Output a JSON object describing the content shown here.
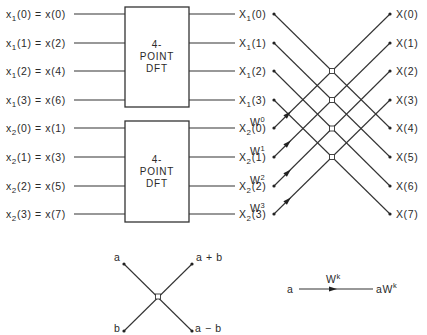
{
  "inputs": [
    {
      "sub": "1",
      "n": "0",
      "rhs": "x(0)"
    },
    {
      "sub": "1",
      "n": "1",
      "rhs": "x(2)"
    },
    {
      "sub": "1",
      "n": "2",
      "rhs": "x(4)"
    },
    {
      "sub": "1",
      "n": "3",
      "rhs": "x(6)"
    },
    {
      "sub": "2",
      "n": "0",
      "rhs": "x(1)"
    },
    {
      "sub": "2",
      "n": "1",
      "rhs": "x(3)"
    },
    {
      "sub": "2",
      "n": "2",
      "rhs": "x(5)"
    },
    {
      "sub": "2",
      "n": "3",
      "rhs": "x(7)"
    }
  ],
  "dft_blocks": [
    {
      "line1": "4-",
      "line2": "POINT",
      "line3": "DFT"
    },
    {
      "line1": "4-",
      "line2": "POINT",
      "line3": "DFT"
    }
  ],
  "intermediate": [
    {
      "sub": "1",
      "n": "0"
    },
    {
      "sub": "1",
      "n": "1"
    },
    {
      "sub": "1",
      "n": "2"
    },
    {
      "sub": "1",
      "n": "3"
    },
    {
      "sub": "2",
      "n": "0"
    },
    {
      "sub": "2",
      "n": "1"
    },
    {
      "sub": "2",
      "n": "2"
    },
    {
      "sub": "2",
      "n": "3"
    }
  ],
  "twiddles": [
    {
      "base": "W",
      "exp": "0"
    },
    {
      "base": "W",
      "exp": "1"
    },
    {
      "base": "W",
      "exp": "2"
    },
    {
      "base": "W",
      "exp": "3"
    }
  ],
  "outputs": [
    "X(0)",
    "X(1)",
    "X(2)",
    "X(3)",
    "X(4)",
    "X(5)",
    "X(6)",
    "X(7)"
  ],
  "legend": {
    "butterfly": {
      "in_top": "a",
      "in_bottom": "b",
      "out_top": "a + b",
      "out_bottom": "a − b"
    },
    "multiplier": {
      "input": "a",
      "gain_base": "W",
      "gain_exp": "k",
      "output_base": "aW",
      "output_exp": "k"
    }
  }
}
